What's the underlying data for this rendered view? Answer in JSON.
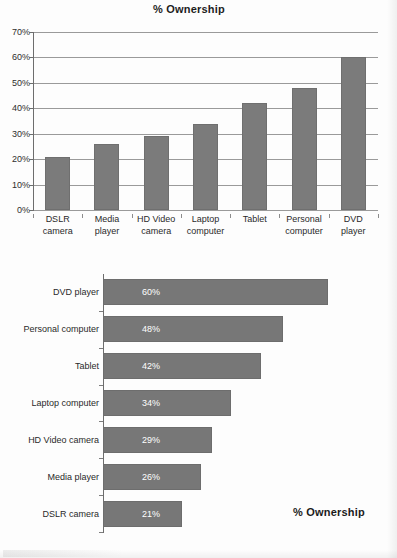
{
  "document": {
    "title": "% Ownership"
  },
  "chart_data": [
    {
      "type": "bar",
      "orientation": "vertical",
      "title": "% Ownership",
      "xlabel": "",
      "ylabel": "",
      "ylim": [
        0,
        70
      ],
      "ytick_labels": [
        "0%",
        "10%",
        "20%",
        "30%",
        "40%",
        "50%",
        "60%",
        "70%"
      ],
      "yticks": [
        0,
        10,
        20,
        30,
        40,
        50,
        60,
        70
      ],
      "grid": true,
      "legend": "none",
      "bar_color": "#7b7b7b",
      "categories": [
        "DSLR\ncamera",
        "Media\nplayer",
        "HD Video\ncamera",
        "Laptop\ncomputer",
        "Tablet",
        "Personal\ncomputer",
        "DVD\nplayer"
      ],
      "category_lines": [
        [
          "DSLR",
          "camera"
        ],
        [
          "Media",
          "player"
        ],
        [
          "HD Video",
          "camera"
        ],
        [
          "Laptop",
          "computer"
        ],
        [
          "Tablet",
          ""
        ],
        [
          "Personal",
          "computer"
        ],
        [
          "DVD",
          "player"
        ]
      ],
      "values": [
        21,
        26,
        29,
        34,
        42,
        48,
        60
      ]
    },
    {
      "type": "bar",
      "orientation": "horizontal",
      "title": "",
      "xlabel": "",
      "ylabel": "",
      "xlim": [
        0,
        74
      ],
      "grid": false,
      "legend": "% Ownership",
      "legend_position": "bottom-right",
      "bar_color": "#777777",
      "data_label_color": "#ffffff",
      "categories": [
        "DVD player",
        "Personal computer",
        "Tablet",
        "Laptop computer",
        "HD Video camera",
        "Media player",
        "DSLR camera"
      ],
      "values": [
        60,
        48,
        42,
        34,
        29,
        26,
        21
      ],
      "data_labels": [
        "60%",
        "48%",
        "42%",
        "34%",
        "29%",
        "26%",
        "21%"
      ]
    }
  ]
}
